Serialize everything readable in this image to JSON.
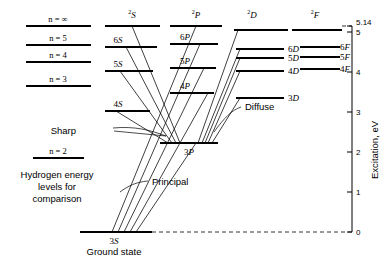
{
  "figure": {
    "kind": "grotrian-energy-level-diagram",
    "axis": {
      "label": "Excitation, eV",
      "ticks": [
        {
          "value": 0,
          "label": "0",
          "y": 232
        },
        {
          "value": 1,
          "label": "1",
          "y": 192
        },
        {
          "value": 2,
          "label": "2",
          "y": 152
        },
        {
          "value": 3,
          "label": "3",
          "y": 112
        },
        {
          "value": 4,
          "label": "4",
          "y": 72
        },
        {
          "value": 5,
          "label": "5",
          "y": 32
        },
        {
          "value": 5.14,
          "label": "5.14",
          "y": 26
        }
      ],
      "limit_label": "5.14",
      "range": [
        0,
        5.14
      ],
      "x": 352
    },
    "hydrogen": {
      "caption_lines": [
        "Hydrogen energy",
        "levels for",
        "comparison"
      ],
      "levels": [
        {
          "label": "n = ∞",
          "n": "inf",
          "y": 26
        },
        {
          "label": "n = 5",
          "n": "5",
          "y": 45
        },
        {
          "label": "n = 4",
          "n": "4",
          "y": 62
        },
        {
          "label": "n = 3",
          "n": "3",
          "y": 86
        },
        {
          "label": "n = 2",
          "n": "2",
          "y": 158
        }
      ]
    },
    "columns": [
      {
        "id": "S",
        "header": "S",
        "header_sup": "2",
        "label_side": "left",
        "x1": 105,
        "x2": 160,
        "levels": [
          {
            "label": "",
            "y": 26,
            "is_limit": true
          },
          {
            "label": "6S",
            "y": 47
          },
          {
            "label": "5S",
            "y": 71
          },
          {
            "label": "4S",
            "y": 111
          }
        ]
      },
      {
        "id": "P",
        "header": "P",
        "header_sup": "2",
        "label_side": "left",
        "x1": 170,
        "x2": 222,
        "levels": [
          {
            "label": "",
            "y": 26,
            "is_limit": true
          },
          {
            "label": "6P",
            "y": 44
          },
          {
            "label": "5P",
            "y": 68
          },
          {
            "label": "4P",
            "y": 93
          },
          {
            "label": "3P",
            "y": 143,
            "is_ground_excited": true
          }
        ]
      },
      {
        "id": "D",
        "header": "D",
        "header_sup": "2",
        "label_side": "right",
        "x1": 232,
        "x2": 288,
        "levels": [
          {
            "label": "",
            "y": 30,
            "is_limit": true
          },
          {
            "label": "6D",
            "y": 49
          },
          {
            "label": "5D",
            "y": 58
          },
          {
            "label": "4D",
            "y": 71
          },
          {
            "label": "3D",
            "y": 98
          }
        ]
      },
      {
        "id": "F",
        "header": "F",
        "header_sup": "2",
        "label_side": "right",
        "x1": 290,
        "x2": 345,
        "levels": [
          {
            "label": "",
            "y": 30,
            "is_limit": true
          },
          {
            "label": "6F",
            "y": 47
          },
          {
            "label": "5F",
            "y": 57
          },
          {
            "label": "4F",
            "y": 69
          }
        ]
      }
    ],
    "ground_state": {
      "label": "3S",
      "caption": "Ground state",
      "y": 232,
      "x1": 80,
      "x2": 152
    },
    "series_annotations": [
      {
        "name": "Sharp",
        "x": 78,
        "y": 131
      },
      {
        "name": "Diffuse",
        "x": 243,
        "y": 110
      },
      {
        "name": "Principal",
        "x": 150,
        "y": 184
      }
    ]
  }
}
